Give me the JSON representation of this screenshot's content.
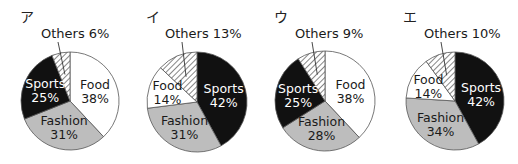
{
  "chart_data": [
    {
      "type": "pie",
      "label": "ア",
      "start": "top",
      "direction": "clockwise",
      "slices": [
        {
          "name": "Food",
          "value": 38,
          "fill": "white"
        },
        {
          "name": "Fashion",
          "value": 31,
          "fill": "gray"
        },
        {
          "name": "Sports",
          "value": 25,
          "fill": "black"
        },
        {
          "name": "Others",
          "value": 6,
          "fill": "hatch"
        }
      ]
    },
    {
      "type": "pie",
      "label": "イ",
      "start": "top",
      "direction": "clockwise",
      "slices": [
        {
          "name": "Sports",
          "value": 42,
          "fill": "black"
        },
        {
          "name": "Fashion",
          "value": 31,
          "fill": "gray"
        },
        {
          "name": "Food",
          "value": 14,
          "fill": "white"
        },
        {
          "name": "Others",
          "value": 13,
          "fill": "hatch"
        }
      ]
    },
    {
      "type": "pie",
      "label": "ウ",
      "start": "top",
      "direction": "clockwise",
      "slices": [
        {
          "name": "Food",
          "value": 38,
          "fill": "white"
        },
        {
          "name": "Fashion",
          "value": 28,
          "fill": "gray"
        },
        {
          "name": "Sports",
          "value": 25,
          "fill": "black"
        },
        {
          "name": "Others",
          "value": 9,
          "fill": "hatch"
        }
      ]
    },
    {
      "type": "pie",
      "label": "エ",
      "start": "top",
      "direction": "clockwise",
      "slices": [
        {
          "name": "Sports",
          "value": 42,
          "fill": "black"
        },
        {
          "name": "Fashion",
          "value": 34,
          "fill": "gray"
        },
        {
          "name": "Food",
          "value": 14,
          "fill": "white"
        },
        {
          "name": "Others",
          "value": 10,
          "fill": "hatch"
        }
      ]
    }
  ],
  "colors": {
    "black": "#111111",
    "gray": "#bdbdbd",
    "white": "#ffffff",
    "hatch_line": "#444444",
    "outline": "#555555",
    "text_dark": "#1a1a1a",
    "text_light": "#ffffff"
  },
  "percent_suffix": "%"
}
